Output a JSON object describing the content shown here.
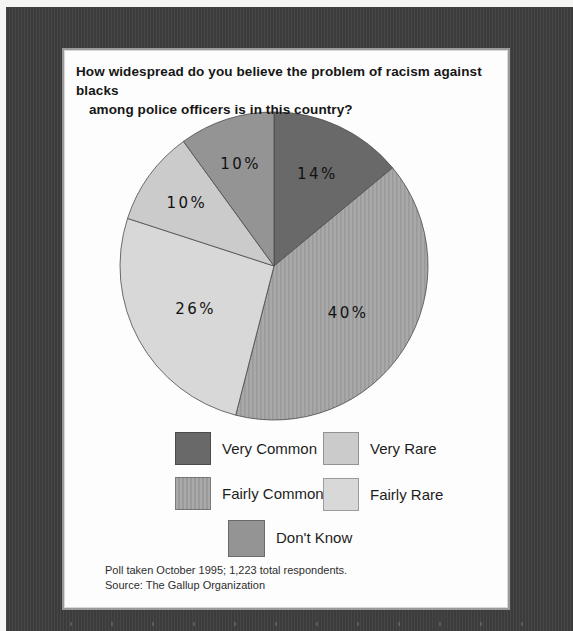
{
  "figure": {
    "title_line1": "How widespread do you believe the problem of racism against blacks",
    "title_line2": "among police officers is in this country?",
    "footnote_line1": "Poll taken October 1995; 1,223 total respondents.",
    "footnote_line2": "Source: The Gallup Organization"
  },
  "chart_data": {
    "type": "pie",
    "title": "How widespread do you believe the problem of racism against blacks among police officers is in this country?",
    "categories": [
      "Very Common",
      "Fairly Common",
      "Fairly Rare",
      "Very Rare",
      "Don't Know"
    ],
    "values": [
      14,
      40,
      26,
      10,
      10
    ],
    "start_angle_deg": 0,
    "direction": "clockwise",
    "legend_position": "below",
    "poll_date": "October 1995",
    "sample": "1,223 total respondents",
    "source": "The Gallup Organization",
    "slices": [
      {
        "label": "Very Common",
        "value": 14,
        "display": "14%",
        "color": "#696969",
        "pattern": "solid",
        "label_radius_frac": 0.66
      },
      {
        "label": "Fairly Common",
        "value": 40,
        "display": "40%",
        "color": "#a9a9a9",
        "pattern": "vertical-stripes",
        "label_radius_frac": 0.57
      },
      {
        "label": "Fairly Rare",
        "value": 26,
        "display": "26%",
        "color": "#d8d8d8",
        "pattern": "solid",
        "label_radius_frac": 0.58
      },
      {
        "label": "Very Rare",
        "value": 10,
        "display": "10%",
        "color": "#cbcbcb",
        "pattern": "solid",
        "label_radius_frac": 0.7
      },
      {
        "label": "Don't Know",
        "value": 10,
        "display": "10%",
        "color": "#949494",
        "pattern": "solid",
        "label_radius_frac": 0.7
      }
    ],
    "stripe_color": "#9a9a9a",
    "outline_color": "#4a4a4a"
  },
  "legend": {
    "items": [
      {
        "label": "Very Common",
        "color": "#696969",
        "pattern": "solid"
      },
      {
        "label": "Fairly Common",
        "color": "#a9a9a9",
        "pattern": "vertical-stripes"
      },
      {
        "label": "Very Rare",
        "color": "#cbcbcb",
        "pattern": "solid"
      },
      {
        "label": "Fairly Rare",
        "color": "#d8d8d8",
        "pattern": "solid"
      },
      {
        "label": "Don't Know",
        "color": "#949494",
        "pattern": "solid"
      }
    ]
  }
}
